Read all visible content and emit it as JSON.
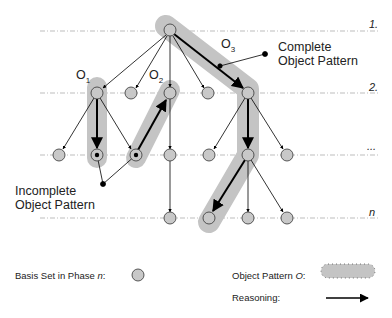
{
  "phases": [
    {
      "label": "1.",
      "y": 31
    },
    {
      "label": "2.",
      "y": 93
    },
    {
      "label": "...",
      "y": 155
    },
    {
      "label": "n",
      "y": 218
    }
  ],
  "pattern_labels": {
    "o1": {
      "base": "O",
      "sub": "1"
    },
    "o2": {
      "base": "O",
      "sub": "2"
    },
    "o3": {
      "base": "O",
      "sub": "3"
    }
  },
  "annotations": {
    "complete": {
      "line1": "Complete",
      "line2": "Object Pattern"
    },
    "incomplete": {
      "line1": "Incomplete",
      "line2": "Object Pattern"
    }
  },
  "legend": {
    "basis_set": {
      "text": "Basis Set in Phase ",
      "var": "n",
      "suffix": ":"
    },
    "object_pattern": {
      "text": "Object Pattern ",
      "var": "O",
      "suffix": ":"
    },
    "reasoning": {
      "text": "Reasoning:"
    }
  },
  "colors": {
    "node_fill": "#c8c8c8",
    "node_stroke": "#333333",
    "pattern_fill": "#c4c4c4",
    "dashed_line": "#bdbdbd",
    "arrow": "#000000"
  },
  "nodes": [
    {
      "id": "r",
      "x": 170,
      "y": 30
    },
    {
      "id": "a1",
      "x": 97,
      "y": 93
    },
    {
      "id": "a2",
      "x": 131,
      "y": 93
    },
    {
      "id": "a3",
      "x": 170,
      "y": 93
    },
    {
      "id": "a4",
      "x": 208,
      "y": 93
    },
    {
      "id": "a5",
      "x": 248,
      "y": 93
    },
    {
      "id": "b1",
      "x": 59,
      "y": 155
    },
    {
      "id": "b2",
      "x": 97,
      "y": 155,
      "marked": true
    },
    {
      "id": "b3",
      "x": 136,
      "y": 155,
      "marked": true
    },
    {
      "id": "b4",
      "x": 170,
      "y": 155
    },
    {
      "id": "b5",
      "x": 209,
      "y": 155
    },
    {
      "id": "b6",
      "x": 248,
      "y": 155
    },
    {
      "id": "b7",
      "x": 287,
      "y": 155
    },
    {
      "id": "c1",
      "x": 170,
      "y": 218
    },
    {
      "id": "c2",
      "x": 209,
      "y": 218
    },
    {
      "id": "c3",
      "x": 248,
      "y": 218
    },
    {
      "id": "c4",
      "x": 287,
      "y": 218
    }
  ]
}
